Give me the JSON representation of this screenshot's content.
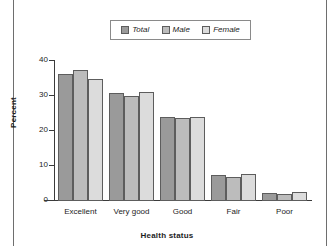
{
  "chart_data": {
    "type": "bar",
    "title": "",
    "xlabel": "Health status",
    "ylabel": "Percent",
    "categories": [
      "Excellent",
      "Very good",
      "Good",
      "Fair",
      "Poor"
    ],
    "series": [
      {
        "name": "Total",
        "color": "#9a9a9a",
        "values": [
          36.2,
          30.8,
          23.9,
          7.4,
          2.4
        ]
      },
      {
        "name": "Male",
        "color": "#bcbcbc",
        "values": [
          37.5,
          30.0,
          23.7,
          7.0,
          1.9
        ]
      },
      {
        "name": "Female",
        "color": "#dcdcdc",
        "values": [
          35.0,
          31.1,
          24.0,
          7.6,
          2.6
        ]
      }
    ],
    "ylim": [
      0,
      40
    ],
    "yticks": [
      0,
      10,
      20,
      30,
      40
    ],
    "ytick_labels": [
      "0",
      "10",
      "20",
      "30",
      "40"
    ],
    "grid": false,
    "legend_position": "top-center"
  },
  "legend": {
    "entries": [
      {
        "label": "Total"
      },
      {
        "label": "Male"
      },
      {
        "label": "Female"
      }
    ]
  },
  "axes": {
    "y_title": "Percent",
    "x_title": "Health status"
  }
}
